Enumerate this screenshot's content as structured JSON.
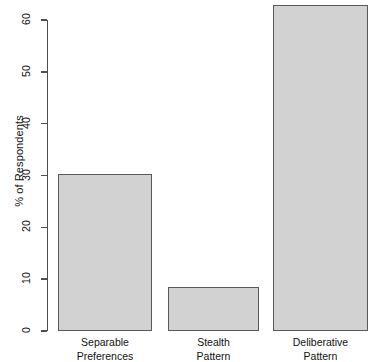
{
  "chart_data": {
    "type": "bar",
    "title": "",
    "xlabel": "",
    "ylabel": "% of Respondents",
    "categories": [
      "Separable Preferences",
      "Stealth Pattern",
      "Deliberative Pattern"
    ],
    "category_lines": [
      [
        "Separable",
        "Preferences"
      ],
      [
        "Stealth",
        "Pattern"
      ],
      [
        "Deliberative",
        "Pattern"
      ]
    ],
    "values": [
      30.3,
      8.5,
      62.9
    ],
    "ylim": [
      0,
      60
    ],
    "yticks": [
      0,
      10,
      20,
      30,
      40,
      50,
      60
    ],
    "ytick_labels": [
      "0",
      "10",
      "20",
      "30",
      "40",
      "50",
      "60"
    ],
    "grid": false,
    "legend": null,
    "bar_fill_color": "#d2d2d2",
    "bar_border_color": "#595959",
    "axis_color": "#4d4d4d",
    "background_color": "#ffffff"
  },
  "axis": {
    "y_title": "% of Respondents"
  }
}
